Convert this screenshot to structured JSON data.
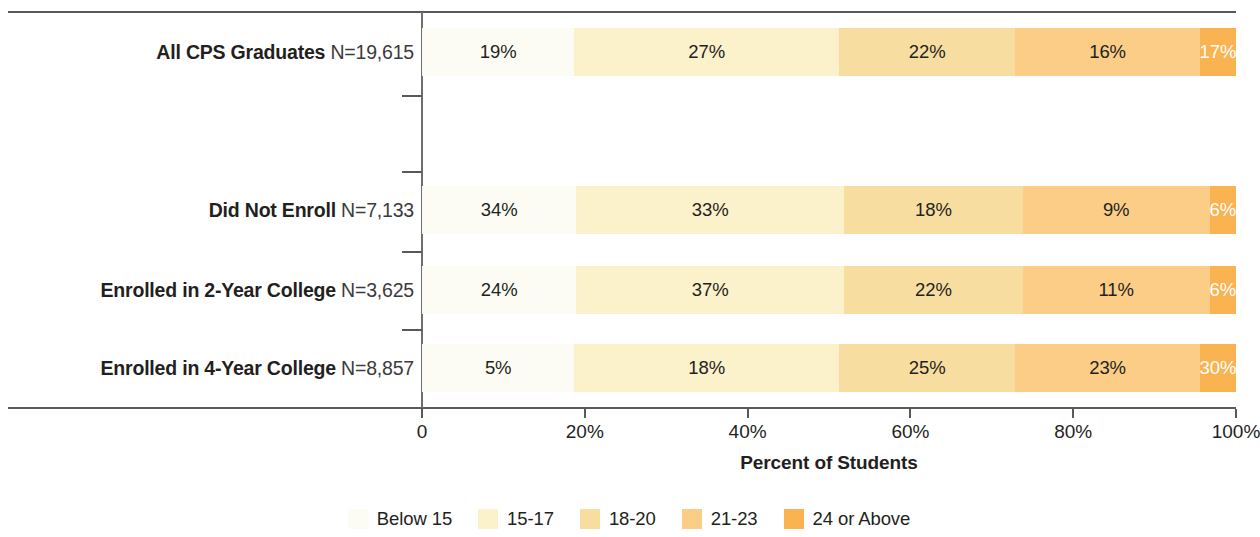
{
  "chart_data": {
    "type": "bar",
    "subtype": "stacked-horizontal-100",
    "title": "",
    "xlabel": "Percent of Students",
    "ylabel": "",
    "xlim": [
      0,
      100
    ],
    "xticks": [
      "0",
      "20%",
      "40%",
      "60%",
      "80%",
      "100%"
    ],
    "xtick_values": [
      0,
      20,
      40,
      60,
      80,
      100
    ],
    "grid": false,
    "legend_position": "bottom",
    "categories": [
      "All CPS Graduates",
      "Did Not Enroll",
      "Enrolled in 2-Year College",
      "Enrolled in 4-Year College"
    ],
    "category_n": [
      "N=19,615",
      "N=7,133",
      "N=3,625",
      "N=8,857"
    ],
    "series": [
      {
        "name": "Below 15",
        "color": "#fdfcf4",
        "values": [
          19,
          34,
          24,
          5
        ]
      },
      {
        "name": "15-17",
        "color": "#fbf1cb",
        "values": [
          27,
          33,
          37,
          18
        ]
      },
      {
        "name": "18-20",
        "color": "#f8ddA0",
        "values": [
          22,
          18,
          22,
          25
        ]
      },
      {
        "name": "21-23",
        "color": "#fbcd86",
        "values": [
          16,
          9,
          11,
          23
        ]
      },
      {
        "name": "24 or Above",
        "color": "#f9b351",
        "values": [
          17,
          6,
          6,
          30
        ]
      }
    ],
    "data_labels": [
      [
        "19%",
        "27%",
        "22%",
        "16%",
        "17%"
      ],
      [
        "34%",
        "33%",
        "18%",
        "9%",
        "6%"
      ],
      [
        "24%",
        "37%",
        "22%",
        "11%",
        "6%"
      ],
      [
        "5%",
        "18%",
        "25%",
        "23%",
        "30%"
      ]
    ],
    "label_is_white": [
      [
        false,
        false,
        false,
        false,
        true
      ],
      [
        false,
        false,
        false,
        false,
        true
      ],
      [
        false,
        false,
        false,
        false,
        true
      ],
      [
        false,
        false,
        false,
        false,
        true
      ]
    ]
  },
  "legend": {
    "items": [
      {
        "label": "Below 15",
        "color": "#fdfcf4"
      },
      {
        "label": "15-17",
        "color": "#fbf1cb"
      },
      {
        "label": "18-20",
        "color": "#f8ddA0"
      },
      {
        "label": "21-23",
        "color": "#fbcd86"
      },
      {
        "label": "24 or Above",
        "color": "#f9b351"
      }
    ]
  },
  "axis": {
    "title": "Percent of Students",
    "ticks": [
      "0",
      "20%",
      "40%",
      "60%",
      "80%",
      "100%"
    ]
  },
  "rows": [
    {
      "label": "All CPS Graduates",
      "n": "N=19,615"
    },
    {
      "label": "Did Not Enroll",
      "n": "N=7,133"
    },
    {
      "label": "Enrolled in 2-Year College",
      "n": "N=3,625"
    },
    {
      "label": "Enrolled in 4-Year College",
      "n": "N=8,857"
    }
  ]
}
